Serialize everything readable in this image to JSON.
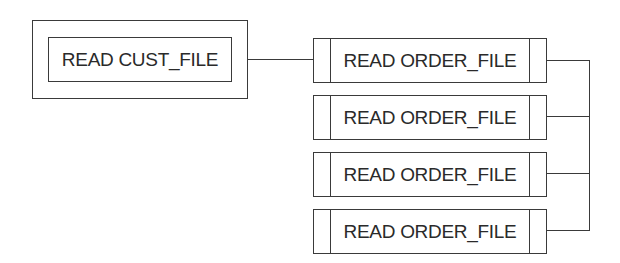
{
  "diagram": {
    "type": "structure-chart",
    "cust_module": {
      "label": "READ CUST_FILE"
    },
    "order_modules": [
      {
        "label": "READ ORDER_FILE"
      },
      {
        "label": "READ ORDER_FILE"
      },
      {
        "label": "READ ORDER_FILE"
      },
      {
        "label": "READ ORDER_FILE"
      }
    ],
    "colors": {
      "line": "#3a3a3a",
      "text": "#2a2a2a",
      "background": "#ffffff"
    }
  }
}
